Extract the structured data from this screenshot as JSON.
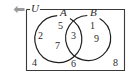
{
  "figure": {
    "type": "venn-diagram",
    "colors": {
      "stroke": "#3a3a3a",
      "text": "#2b2b2b",
      "background": "#ffffff",
      "arrow": "#9a9a9a"
    },
    "universal_set": {
      "label": "U"
    },
    "sets": [
      {
        "id": "A",
        "label": "A"
      },
      {
        "id": "B",
        "label": "B"
      }
    ],
    "icons": {
      "arrow_left": "arrow-left-icon"
    },
    "regions": [
      {
        "id": "a_only",
        "name": "A only",
        "values": [
          "5",
          "2",
          "7"
        ]
      },
      {
        "id": "intersection",
        "name": "A intersect B",
        "values": [
          "3"
        ]
      },
      {
        "id": "b_only",
        "name": "B only",
        "values": [
          "1",
          "9"
        ]
      },
      {
        "id": "outside",
        "name": "outside A and B",
        "values": [
          "4",
          "6",
          "8"
        ]
      }
    ],
    "elements": {
      "n5": "5",
      "n2": "2",
      "n7": "7",
      "n3": "3",
      "n1": "1",
      "n9": "9",
      "n4": "4",
      "n6": "6",
      "n8": "8"
    }
  }
}
